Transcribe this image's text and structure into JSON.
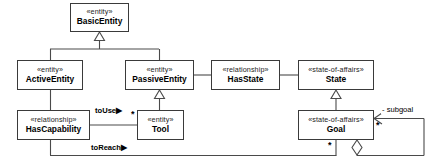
{
  "diagram": {
    "type": "uml-class-diagram",
    "colors": {
      "box_border": "#3a3a3a",
      "line": "#4a4a4a",
      "background": "#ffffff",
      "text": "#000000"
    },
    "classes": [
      {
        "id": "basic-entity",
        "stereotype": "«entity»",
        "name": "BasicEntity",
        "x": 70,
        "y": 3,
        "w": 59,
        "h": 29
      },
      {
        "id": "active-entity",
        "stereotype": "«entity»",
        "name": "ActiveEntity",
        "x": 17,
        "y": 60,
        "w": 66,
        "h": 30
      },
      {
        "id": "passive-entity",
        "stereotype": "«entity»",
        "name": "PassiveEntity",
        "x": 125,
        "y": 60,
        "w": 69,
        "h": 30
      },
      {
        "id": "has-state",
        "stereotype": "«relationship»",
        "name": "HasState",
        "x": 211,
        "y": 60,
        "w": 69,
        "h": 30
      },
      {
        "id": "state",
        "stereotype": "«state-of-affairs»",
        "name": "State",
        "x": 298,
        "y": 60,
        "w": 76,
        "h": 30
      },
      {
        "id": "has-capability",
        "stereotype": "«relationship»",
        "name": "HasCapability",
        "x": 17,
        "y": 110,
        "w": 73,
        "h": 30
      },
      {
        "id": "tool",
        "stereotype": "«entity»",
        "name": "Tool",
        "x": 137,
        "y": 110,
        "w": 47,
        "h": 30
      },
      {
        "id": "goal",
        "stereotype": "«state-of-affairs»",
        "name": "Goal",
        "x": 298,
        "y": 110,
        "w": 76,
        "h": 30
      }
    ],
    "generalizations": [
      {
        "from": "active-entity",
        "to": "basic-entity"
      },
      {
        "from": "passive-entity",
        "to": "basic-entity"
      },
      {
        "from": "tool",
        "to": "passive-entity"
      },
      {
        "from": "goal",
        "to": "state"
      }
    ],
    "associations": [
      {
        "id": "assoc-has-state",
        "from": "passive-entity",
        "to": "has-state",
        "label": ""
      },
      {
        "id": "assoc-state",
        "from": "has-state",
        "to": "state",
        "label": ""
      },
      {
        "id": "assoc-active-hascapability",
        "from": "active-entity",
        "to": "has-capability",
        "label": ""
      },
      {
        "id": "assoc-to-use",
        "from": "has-capability",
        "to": "tool",
        "label": "toUse",
        "arrow": "▶",
        "multiplicity": "*"
      },
      {
        "id": "assoc-to-reach",
        "from": "has-capability",
        "to": "goal",
        "label": "toReach",
        "arrow": "▶",
        "multiplicity": "*"
      },
      {
        "id": "assoc-subgoal",
        "from": "goal",
        "to": "goal",
        "role": "- subgoal",
        "multiplicity": "*",
        "aggregation": "diamond"
      }
    ],
    "labels": {
      "to_use": "toUse▶",
      "to_reach": "toReach▶",
      "subgoal_role": "- subgoal",
      "mult_tool": "*",
      "mult_subgoal": "*",
      "mult_goal_bottom": "*"
    }
  }
}
